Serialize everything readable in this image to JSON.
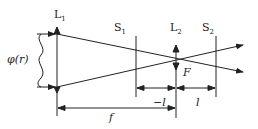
{
  "labels": {
    "lens1": "L",
    "lens1_sub": "1",
    "lens2": "L",
    "lens2_sub": "2",
    "screen1": "S",
    "screen1_sub": "1",
    "screen2": "S",
    "screen2_sub": "2",
    "phase": "φ(r)",
    "focus": "F",
    "minus_l": "−l",
    "l": "l",
    "f": "f"
  },
  "colors": {
    "line": "#222222",
    "background": "#ffffff"
  }
}
